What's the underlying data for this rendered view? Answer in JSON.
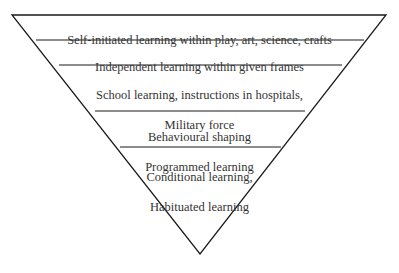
{
  "diagram": {
    "type": "inverted-pyramid",
    "levels": [
      {
        "lines": [
          "Self-initiated learning within play, art, science, crafts"
        ]
      },
      {
        "lines": [
          "Independent learning within given frames"
        ]
      },
      {
        "lines": [
          "School learning, instructions in hospitals,",
          "Military force"
        ]
      },
      {
        "lines": [
          "Behavioural shaping",
          "Programmed learning"
        ]
      },
      {
        "lines": [
          "Conditional learning,",
          "Habituated learning"
        ]
      }
    ],
    "level_text": {
      "l0": "Self-initiated learning within play, art, science, crafts",
      "l1": "Independent learning within given frames",
      "l2a": "School learning, instructions in hospitals,",
      "l2b": "Military force",
      "l3a": "Behavioural shaping",
      "l3b": "Programmed learning",
      "l4a": "Conditional learning,",
      "l4b": "Habituated learning"
    },
    "colors": {
      "stroke": "#1a1a1a",
      "text": "#333333",
      "background": "#ffffff"
    }
  }
}
